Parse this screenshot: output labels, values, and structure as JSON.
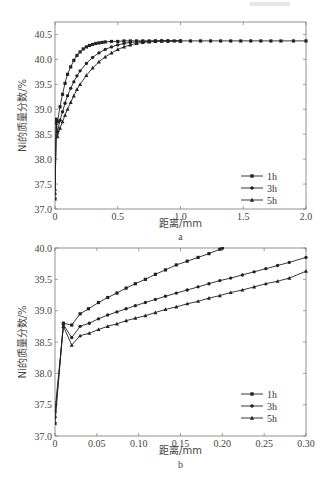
{
  "chart_data": [
    {
      "id": "a",
      "type": "line",
      "subtitle": "a",
      "xlabel": "距离/mm",
      "ylabel": "Ni的质量分数/%",
      "xlim": [
        0,
        2.0
      ],
      "ylim": [
        37.0,
        40.75
      ],
      "xticks": [
        0,
        0.5,
        1.0,
        1.5,
        2.0
      ],
      "xtick_labels": [
        "0",
        "0.5",
        "1.0",
        "1.5",
        "2.0"
      ],
      "yticks": [
        37.0,
        37.5,
        38.0,
        38.5,
        39.0,
        39.5,
        40.0,
        40.5
      ],
      "ytick_labels": [
        "37.0",
        "37.5",
        "38.0",
        "38.5",
        "39.0",
        "39.5",
        "40.0",
        "40.5"
      ],
      "legend_position": "lower right",
      "grid": false,
      "series": [
        {
          "name": "1h",
          "marker": "square",
          "x": [
            0,
            0.01,
            0.02,
            0.04,
            0.06,
            0.08,
            0.1,
            0.125,
            0.15,
            0.175,
            0.2,
            0.225,
            0.25,
            0.275,
            0.3,
            0.325,
            0.35,
            0.375,
            0.4,
            0.45,
            0.5,
            0.55,
            0.6,
            0.65,
            0.7,
            0.75,
            0.8,
            0.85,
            0.9,
            0.95,
            1.0,
            1.08,
            1.16,
            1.24,
            1.32,
            1.4,
            1.48,
            1.56,
            1.64,
            1.72,
            1.8,
            1.9,
            2.0
          ],
          "y": [
            37.2,
            38.8,
            38.75,
            39.05,
            39.3,
            39.52,
            39.7,
            39.85,
            39.98,
            40.08,
            40.15,
            40.21,
            40.25,
            40.28,
            40.3,
            40.32,
            40.33,
            40.34,
            40.35,
            40.36,
            40.36,
            40.37,
            40.37,
            40.37,
            40.37,
            40.37,
            40.37,
            40.37,
            40.37,
            40.37,
            40.37,
            40.37,
            40.37,
            40.37,
            40.37,
            40.37,
            40.37,
            40.37,
            40.37,
            40.37,
            40.37,
            40.37,
            40.37
          ]
        },
        {
          "name": "3h",
          "marker": "circle",
          "x": [
            0,
            0.01,
            0.02,
            0.04,
            0.06,
            0.08,
            0.1,
            0.125,
            0.15,
            0.175,
            0.2,
            0.25,
            0.3,
            0.35,
            0.4,
            0.45,
            0.5,
            0.55,
            0.6,
            0.65,
            0.7,
            0.75,
            0.8,
            0.85,
            0.9,
            1.0
          ],
          "y": [
            37.3,
            38.75,
            38.55,
            38.78,
            38.95,
            39.12,
            39.27,
            39.42,
            39.55,
            39.67,
            39.77,
            39.92,
            40.04,
            40.13,
            40.2,
            40.25,
            40.29,
            40.32,
            40.34,
            40.35,
            40.36,
            40.36,
            40.37,
            40.37,
            40.37,
            40.37
          ]
        },
        {
          "name": "5h",
          "marker": "triangle",
          "x": [
            0,
            0.01,
            0.02,
            0.04,
            0.06,
            0.08,
            0.1,
            0.125,
            0.15,
            0.175,
            0.2,
            0.25,
            0.3,
            0.35,
            0.4,
            0.45,
            0.5,
            0.55,
            0.6,
            0.65,
            0.7,
            0.75,
            0.8,
            0.85,
            0.9,
            1.0
          ],
          "y": [
            37.4,
            38.72,
            38.45,
            38.62,
            38.75,
            38.88,
            39.0,
            39.14,
            39.27,
            39.4,
            39.5,
            39.68,
            39.83,
            39.95,
            40.05,
            40.13,
            40.2,
            40.25,
            40.29,
            40.32,
            40.34,
            40.35,
            40.36,
            40.37,
            40.37,
            40.37
          ]
        }
      ]
    },
    {
      "id": "b",
      "type": "line",
      "subtitle": "b",
      "xlabel": "距离/mm",
      "ylabel": "Ni的质量分数/%",
      "xlim": [
        0,
        0.3
      ],
      "ylim": [
        37.0,
        40.0
      ],
      "xticks": [
        0,
        0.05,
        0.1,
        0.15,
        0.2,
        0.25,
        0.3
      ],
      "xtick_labels": [
        "0",
        "0.05",
        "0.10",
        "0.15",
        "0.20",
        "0.25",
        "0.30"
      ],
      "yticks": [
        37.0,
        37.5,
        38.0,
        38.5,
        39.0,
        39.5,
        40.0
      ],
      "ytick_labels": [
        "37.0",
        "37.5",
        "38.0",
        "38.5",
        "39.0",
        "39.5",
        "40.0"
      ],
      "legend_position": "lower right",
      "grid": false,
      "series": [
        {
          "name": "1h",
          "marker": "square",
          "x": [
            0,
            0.01,
            0.02,
            0.03,
            0.04,
            0.052,
            0.063,
            0.074,
            0.085,
            0.096,
            0.108,
            0.12,
            0.132,
            0.145,
            0.158,
            0.171,
            0.184,
            0.197,
            0.2
          ],
          "y": [
            37.2,
            38.8,
            38.77,
            38.95,
            39.03,
            39.13,
            39.21,
            39.28,
            39.36,
            39.43,
            39.5,
            39.58,
            39.65,
            39.73,
            39.79,
            39.85,
            39.91,
            39.98,
            40.0
          ]
        },
        {
          "name": "3h",
          "marker": "circle",
          "x": [
            0,
            0.01,
            0.02,
            0.03,
            0.041,
            0.052,
            0.063,
            0.074,
            0.085,
            0.096,
            0.108,
            0.12,
            0.132,
            0.145,
            0.158,
            0.171,
            0.184,
            0.197,
            0.21,
            0.224,
            0.238,
            0.252,
            0.266,
            0.28,
            0.3
          ],
          "y": [
            37.3,
            38.78,
            38.57,
            38.75,
            38.8,
            38.87,
            38.93,
            38.98,
            39.03,
            39.08,
            39.13,
            39.18,
            39.23,
            39.28,
            39.33,
            39.38,
            39.43,
            39.48,
            39.52,
            39.57,
            39.62,
            39.67,
            39.72,
            39.77,
            39.85
          ]
        },
        {
          "name": "5h",
          "marker": "triangle",
          "x": [
            0,
            0.01,
            0.02,
            0.03,
            0.041,
            0.052,
            0.063,
            0.074,
            0.085,
            0.096,
            0.108,
            0.12,
            0.132,
            0.145,
            0.158,
            0.171,
            0.184,
            0.197,
            0.21,
            0.224,
            0.238,
            0.252,
            0.266,
            0.28,
            0.3
          ],
          "y": [
            37.4,
            38.75,
            38.45,
            38.6,
            38.64,
            38.7,
            38.75,
            38.79,
            38.84,
            38.88,
            38.92,
            38.97,
            39.02,
            39.06,
            39.11,
            39.15,
            39.2,
            39.24,
            39.29,
            39.33,
            39.38,
            39.43,
            39.47,
            39.52,
            39.63
          ]
        }
      ]
    }
  ],
  "layout": {
    "panels": [
      {
        "left": 55,
        "right": 306,
        "top": 22,
        "bottom": 209,
        "legend_x": 263,
        "legend_y": 176,
        "xlabel_y": 227,
        "sub_y": 240
      },
      {
        "left": 55,
        "right": 306,
        "top": 248,
        "bottom": 436,
        "legend_x": 263,
        "legend_y": 394,
        "xlabel_y": 454,
        "sub_y": 468
      }
    ]
  },
  "colors": {
    "line": "#222222",
    "axis": "#777777",
    "text": "#444444"
  }
}
